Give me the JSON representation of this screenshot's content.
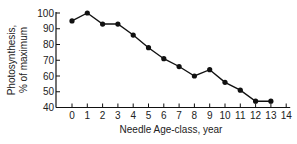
{
  "chart_data": {
    "type": "line",
    "title": "",
    "xlabel": "Needle Age-class, year",
    "ylabel_line1": "Photosynthesis,",
    "ylabel_line2": "% of maximum",
    "ylabel": "Photosynthesis, % of maximum",
    "x": [
      0,
      1,
      2,
      3,
      4,
      5,
      6,
      7,
      8,
      9,
      10,
      11,
      12,
      13
    ],
    "values": [
      95,
      100,
      93,
      93,
      86,
      78,
      71,
      66,
      60,
      64,
      56,
      51,
      44,
      44
    ],
    "xticks": [
      "0",
      "1",
      "2",
      "3",
      "4",
      "5",
      "6",
      "7",
      "8",
      "9",
      "10",
      "11",
      "12",
      "13",
      "14"
    ],
    "yticks": [
      "40",
      "50",
      "60",
      "70",
      "80",
      "90",
      "100"
    ],
    "xlim": [
      0,
      14
    ],
    "ylim": [
      40,
      100
    ],
    "grid": false,
    "legend": null,
    "marker": "filled-circle",
    "line_color": "#111111"
  }
}
